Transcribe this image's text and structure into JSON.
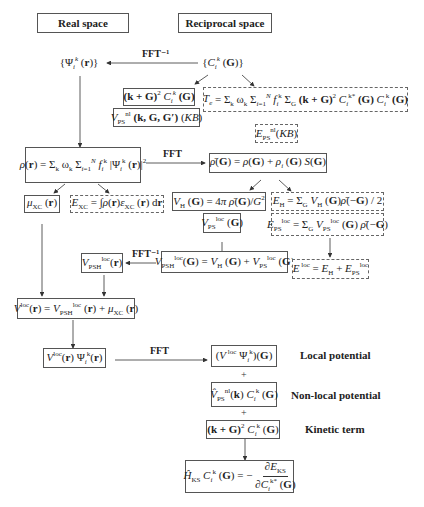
{
  "headers": {
    "real_space": "Real space",
    "reciprocal_space": "Reciprocal space"
  },
  "arrows": {
    "fft_inverse_top": "FFT⁻¹",
    "fft_density": "FFT",
    "fft_inverse_potential": "FFT⁻¹",
    "fft_product": "FFT"
  },
  "nodes": {
    "psi_r": "{Ψᵢᵏ(r)}",
    "c_g": "{Cᵢᵏ(G)}",
    "kinetic_coeff": "(k+G)² Cᵢᵏ(G)",
    "vnl_kb": "V_PS^nl (k, G, G′) (KB)",
    "kinetic_energy": "T_e = Σ_k ω_k Σ_{i=1}^N f_i^k Σ_G (k+G)² C_i^k*(G) C_i^k(G)",
    "enl_kb": "E_PS^nl (KB)",
    "density_r": "ρ(r) = Σ_k ω_k Σ_{i=1}^N f_i^k |Ψ_i^k(r)|²",
    "density_g": "ρ̄(G) = ρ(G) + ρ_i(G) S(G)",
    "mu_xc": "μ_XC(r)",
    "e_xc": "E_XC = ∫ρ(r)ε_XC(r) dr",
    "v_hartree": "V_H(G) = 4π ρ̄(G)/G²",
    "e_hartree": "E_H = Σ_G V_H(G) ρ̄(−G) / 2",
    "vps_loc_g": "V_PS^loc(G)",
    "eps_loc": "E_PS^loc = Σ_G V_PS^loc(G) ρ̄(−G)",
    "vpsh_loc_r": "V_PSH^loc(r)",
    "vpsh_loc_g": "V_PSH^loc(G) = V_H(G) + V_PS^loc(G)",
    "e_loc": "E^loc = E_H + E_PS^loc",
    "v_loc_r": "V^loc(r) = V_PSH^loc(r) + μ_XC(r)",
    "vloc_psi_r": "V^loc(r) Ψ_i^k(r)",
    "vloc_psi_g": "(V^loc Ψ_i^k)(G)",
    "vnl_c": "V̂_PS^nl(k) C_i^k(G)",
    "kinetic_term_expr": "(k+G)² C_i^k(G)",
    "hks": "Ĥ_KS C_i^k(G) = −∂E_KS / ∂C_i^k*(G)"
  },
  "side_labels": {
    "local_potential": "Local potential",
    "nonlocal_potential": "Non-local potential",
    "kinetic_term": "Kinetic term"
  },
  "operators": {
    "plus1": "+",
    "plus2": "+"
  }
}
